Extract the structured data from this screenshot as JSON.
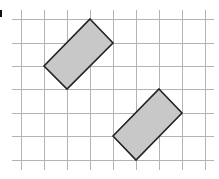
{
  "diagram": {
    "type": "grid-with-rotated-rectangles",
    "colors": {
      "background": "#ffffff",
      "grid_line": "#b4b4b4",
      "shape_fill": "#c8c8c8",
      "shape_stroke": "#222222",
      "label_fragment": "#111111"
    },
    "grid": {
      "x_extent": [
        12,
        214
      ],
      "y_extent": [
        10,
        170
      ],
      "vertical_lines_x": [
        21,
        44,
        67,
        90,
        113,
        136,
        159,
        182,
        205
      ],
      "horizontal_lines_y": [
        19,
        43,
        66,
        89,
        113,
        136,
        160
      ]
    },
    "shapes": [
      {
        "name": "upper-rectangle",
        "grid_vertices": [
          [
            3,
            0
          ],
          [
            4,
            1
          ],
          [
            2,
            3
          ],
          [
            1,
            2
          ]
        ],
        "points": "90,19 113,43 67,89 44,66"
      },
      {
        "name": "lower-rectangle",
        "grid_vertices": [
          [
            6,
            3
          ],
          [
            7,
            4
          ],
          [
            5,
            6
          ],
          [
            4,
            5
          ]
        ],
        "points": "159,89 182,113 136,160 113,136"
      }
    ]
  }
}
